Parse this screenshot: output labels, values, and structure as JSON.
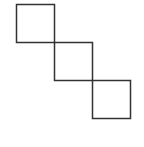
{
  "diagram": {
    "stroke_color": "#333333",
    "background": "#ffffff",
    "squares": [
      {
        "x": 16,
        "y": 4,
        "size": 38
      },
      {
        "x": 54,
        "y": 42,
        "size": 38
      },
      {
        "x": 92,
        "y": 80,
        "size": 38
      }
    ]
  }
}
